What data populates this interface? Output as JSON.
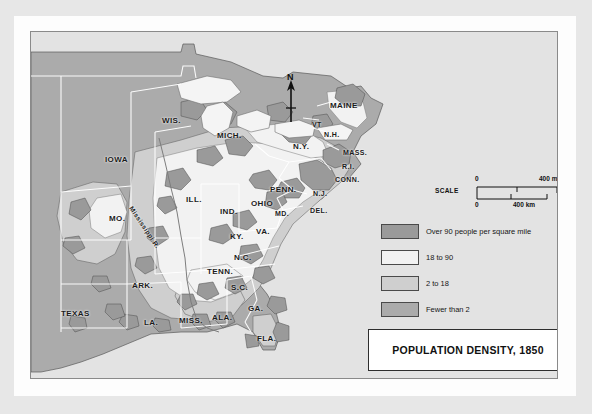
{
  "map": {
    "title": "POPULATION DENSITY, 1850",
    "north_label": "N",
    "river_label": "Mississippi R.",
    "scale": {
      "word": "SCALE",
      "top_zero": "0",
      "top_max": "400 mi",
      "bottom_zero": "0",
      "bottom_max": "400 km"
    },
    "legend": [
      {
        "label": "Over 90 people per square mile",
        "color": "#9a9a9a"
      },
      {
        "label": "18 to 90",
        "color": "#f2f2f2"
      },
      {
        "label": "2 to 18",
        "color": "#cfcfcf"
      },
      {
        "label": "Fewer than 2",
        "color": "#ababab"
      }
    ],
    "colors": {
      "page": "#e7e7e7",
      "mat": "#fdfdfd",
      "ocean": "#e3e3e3",
      "fewer_than_2": "#ababab",
      "two_to_18": "#cfcfcf",
      "eighteen_to_90": "#f2f2f2",
      "over_90": "#9a9a9a",
      "lake": "#f4f4f4",
      "border": "#ffffff",
      "outline": "#4d4d4d",
      "text": "#1b1b1b"
    },
    "state_labels": [
      {
        "text": "WIS.",
        "x": 131,
        "y": 84,
        "size": "big"
      },
      {
        "text": "MICH.",
        "x": 186,
        "y": 99,
        "size": "big"
      },
      {
        "text": "IOWA",
        "x": 74,
        "y": 123,
        "size": "big"
      },
      {
        "text": "OHIO",
        "x": 220,
        "y": 167,
        "size": "big"
      },
      {
        "text": "IND.",
        "x": 189,
        "y": 175,
        "size": "big"
      },
      {
        "text": "ILL.",
        "x": 155,
        "y": 163,
        "size": "big"
      },
      {
        "text": "MO.",
        "x": 78,
        "y": 182,
        "size": "big"
      },
      {
        "text": "KY.",
        "x": 199,
        "y": 200,
        "size": "big"
      },
      {
        "text": "TENN.",
        "x": 176,
        "y": 235,
        "size": "big"
      },
      {
        "text": "ARK.",
        "x": 101,
        "y": 249,
        "size": "big"
      },
      {
        "text": "MISS.",
        "x": 148,
        "y": 284,
        "size": "big"
      },
      {
        "text": "ALA.",
        "x": 181,
        "y": 281,
        "size": "big"
      },
      {
        "text": "LA.",
        "x": 113,
        "y": 286,
        "size": "big"
      },
      {
        "text": "TEXAS",
        "x": 30,
        "y": 277,
        "size": "big"
      },
      {
        "text": "GA.",
        "x": 217,
        "y": 272,
        "size": "big"
      },
      {
        "text": "FLA.",
        "x": 226,
        "y": 302,
        "size": "big"
      },
      {
        "text": "S.C.",
        "x": 200,
        "y": 251,
        "size": "big"
      },
      {
        "text": "N.C.",
        "x": 203,
        "y": 221,
        "size": "big"
      },
      {
        "text": "VA.",
        "x": 225,
        "y": 195,
        "size": "big"
      },
      {
        "text": "MD.",
        "x": 244,
        "y": 178,
        "size": ""
      },
      {
        "text": "DEL.",
        "x": 279,
        "y": 175,
        "size": ""
      },
      {
        "text": "N.J.",
        "x": 282,
        "y": 158,
        "size": ""
      },
      {
        "text": "PENN.",
        "x": 239,
        "y": 153,
        "size": "big"
      },
      {
        "text": "N.Y.",
        "x": 262,
        "y": 110,
        "size": "big"
      },
      {
        "text": "CONN.",
        "x": 304,
        "y": 144,
        "size": ""
      },
      {
        "text": "R.I.",
        "x": 311,
        "y": 131,
        "size": ""
      },
      {
        "text": "MASS.",
        "x": 312,
        "y": 117,
        "size": ""
      },
      {
        "text": "N.H.",
        "x": 293,
        "y": 99,
        "size": ""
      },
      {
        "text": "VT",
        "x": 281,
        "y": 89,
        "size": ""
      },
      {
        "text": "MAINE",
        "x": 299,
        "y": 69,
        "size": "big"
      }
    ]
  }
}
